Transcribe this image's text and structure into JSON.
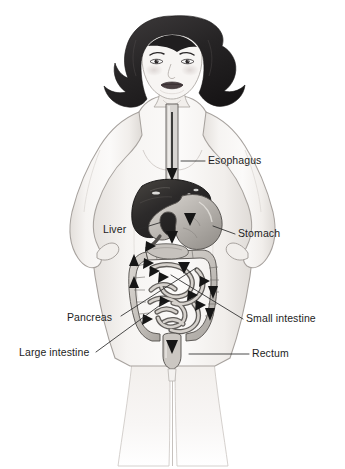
{
  "figure": {
    "kind": "anatomical-illustration",
    "background_color": "#ffffff",
    "canvas": {
      "width": 345,
      "height": 469
    }
  },
  "person": {
    "description": "Front-facing woman with short dark bobbed hair, hands on hips, shown from head to thighs with internal digestive organs drawn over the torso",
    "hair_color": "#2d2b2c",
    "skin_color": "#f3f1ef",
    "outline_color": "#8f8b88",
    "lip_color": "#4a4042"
  },
  "labels": [
    {
      "id": "esophagus",
      "text": "Esophagus",
      "side": "right",
      "text_x": 208,
      "text_y": 154,
      "leader_from": [
        205,
        161
      ],
      "leader_to": [
        181,
        161
      ]
    },
    {
      "id": "liver",
      "text": "Liver",
      "side": "left",
      "text_x": 103,
      "text_y": 223,
      "leader_from": [
        136,
        230
      ],
      "leader_to": [
        162,
        222
      ]
    },
    {
      "id": "stomach",
      "text": "Stomach",
      "side": "right",
      "text_x": 238,
      "text_y": 227,
      "leader_from": [
        235,
        234
      ],
      "leader_to": [
        213,
        226
      ]
    },
    {
      "id": "pancreas",
      "text": "Pancreas",
      "side": "left",
      "text_x": 67,
      "text_y": 311,
      "leader_from": [
        121,
        316
      ],
      "leader_to": [
        196,
        268
      ]
    },
    {
      "id": "small-intestine",
      "text": "Small intestine",
      "side": "right",
      "text_x": 246,
      "text_y": 312,
      "leader_from": [
        243,
        319
      ],
      "leader_to": [
        171,
        275
      ]
    },
    {
      "id": "large-intestine",
      "text": "Large intestine",
      "side": "left",
      "text_x": 19,
      "text_y": 346,
      "leader_from": [
        96,
        352
      ],
      "leader_to": [
        163,
        303
      ]
    },
    {
      "id": "rectum",
      "text": "Rectum",
      "side": "right",
      "text_x": 252,
      "text_y": 347,
      "leader_from": [
        249,
        354
      ],
      "leader_to": [
        189,
        354
      ]
    }
  ],
  "organs": [
    {
      "id": "esophagus",
      "name": "Esophagus",
      "fill": "#d8d5d2",
      "stroke": "#5d5a58"
    },
    {
      "id": "liver",
      "name": "Liver",
      "fill": "#2e2c2d",
      "stroke": "#1a1819"
    },
    {
      "id": "stomach",
      "name": "Stomach",
      "fill": "#b6b2ad",
      "stroke": "#55524f"
    },
    {
      "id": "pancreas",
      "name": "Pancreas",
      "fill": "#c6c2bd",
      "stroke": "#5a5754"
    },
    {
      "id": "small-intestine",
      "name": "Small intestine",
      "fill": "#cecac5",
      "stroke": "#5a5754"
    },
    {
      "id": "large-intestine",
      "name": "Large intestine",
      "fill": "#c2beb9",
      "stroke": "#514e4b"
    },
    {
      "id": "rectum",
      "name": "Rectum",
      "fill": "#cbc7c2",
      "stroke": "#55524f"
    }
  ],
  "flow_arrows": {
    "description": "Black triangular arrowheads tracing the path of food through the digestive tract",
    "color": "#161616",
    "count": 16
  },
  "palette": {
    "ink": "#1d1d1d",
    "leader_line": "#2a2a2a",
    "body_fill": "#f4f2f0",
    "body_shadow": "#ddd9d5",
    "hair": "#2d2b2c"
  }
}
